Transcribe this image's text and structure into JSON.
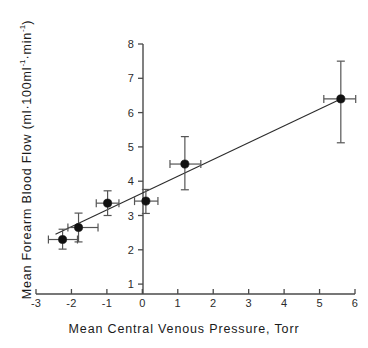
{
  "chart_data": {
    "type": "scatter",
    "title": "",
    "xlabel": "Mean Central Venous Pressure, Torr",
    "ylabel_plain": "Mean Forearm Blood Flow (ml·100ml⁻¹·min⁻¹)",
    "ylabel_parts": {
      "lead": "Mean Forearm Blood Flow  (ml·100ml",
      "exp1": "-1",
      "mid": "·min",
      "exp2": "-1",
      "tail": ")"
    },
    "xlim": [
      -3,
      6
    ],
    "ylim": [
      0,
      8
    ],
    "xticks": [
      -3,
      -2,
      -1,
      0,
      1,
      2,
      3,
      4,
      5,
      6
    ],
    "xticklabels": [
      "-3",
      "-2",
      "-1",
      "0",
      "1",
      "2",
      "3",
      "4",
      "5",
      "6"
    ],
    "yticks": [
      1,
      2,
      3,
      4,
      5,
      6,
      7,
      8
    ],
    "yticklabels": [
      "1",
      "2",
      "3",
      "4",
      "5",
      "6",
      "7",
      "8"
    ],
    "grid": false,
    "legend": null,
    "axis_color": "#4a4a4a",
    "marker_color": "#111111",
    "line_color": "#2b2b2b",
    "error_color": "#555555",
    "points": [
      {
        "x": -2.25,
        "y": 2.3,
        "xerr_low": 0.4,
        "xerr_high": 0.42,
        "yerr_low": 0.28,
        "yerr_high": 0.3
      },
      {
        "x": -1.8,
        "y": 2.65,
        "xerr_low": 0.3,
        "xerr_high": 0.55,
        "yerr_low": 0.42,
        "yerr_high": 0.42
      },
      {
        "x": -0.98,
        "y": 3.36,
        "xerr_low": 0.32,
        "xerr_high": 0.32,
        "yerr_low": 0.36,
        "yerr_high": 0.36
      },
      {
        "x": 0.1,
        "y": 3.42,
        "xerr_low": 0.32,
        "xerr_high": 0.34,
        "yerr_low": 0.36,
        "yerr_high": 0.34
      },
      {
        "x": 1.2,
        "y": 4.5,
        "xerr_low": 0.42,
        "xerr_high": 0.45,
        "yerr_low": 0.75,
        "yerr_high": 0.8
      },
      {
        "x": 5.6,
        "y": 6.4,
        "xerr_low": 0.48,
        "xerr_high": 0.42,
        "yerr_low": 1.28,
        "yerr_high": 1.1
      }
    ],
    "fit_line": {
      "x_start": -2.45,
      "y_start": 2.45,
      "x_end": 5.6,
      "y_end": 6.4
    }
  }
}
